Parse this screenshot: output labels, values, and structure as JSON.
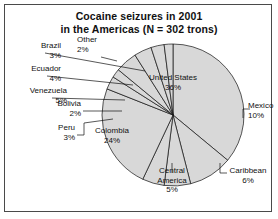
{
  "chart_data": {
    "type": "pie",
    "title": "Cocaine seizures in 2001 in the Americas (N = 302 trons)",
    "title_line1": "Cocaine seizures in 2001",
    "title_line2": "in the Americas (N = 302 trons)",
    "unit": "percent",
    "total_label": "N = 302 trons",
    "legend": "none",
    "grid": false,
    "slice_fill": "#d8d8d8",
    "slice_stroke": "#111111",
    "categories": [
      "United States",
      "Mexico",
      "Caribbean",
      "Central America",
      "Colombia",
      "Peru",
      "Bolivia",
      "Venezuela",
      "Ecuador",
      "Brazil",
      "Other"
    ],
    "values": [
      36,
      10,
      6,
      5,
      24,
      3,
      2,
      5,
      4,
      3,
      2
    ],
    "slices": [
      {
        "name": "United States",
        "pct": 36,
        "label": "United States",
        "value_label": "36%",
        "placement": "inside"
      },
      {
        "name": "Mexico",
        "pct": 10,
        "label": "Mexico",
        "value_label": "10%",
        "placement": "outside"
      },
      {
        "name": "Caribbean",
        "pct": 6,
        "label": "Caribbean",
        "value_label": "6%",
        "placement": "outside"
      },
      {
        "name": "Central America",
        "pct": 5,
        "label_line1": "Central",
        "label_line2": "America",
        "value_label": "5%",
        "placement": "outside"
      },
      {
        "name": "Colombia",
        "pct": 24,
        "label": "Colombia",
        "value_label": "24%",
        "placement": "inside"
      },
      {
        "name": "Peru",
        "pct": 3,
        "label": "Peru",
        "value_label": "3%",
        "placement": "outside"
      },
      {
        "name": "Bolivia",
        "pct": 2,
        "label": "Bolivia",
        "value_label": "2%",
        "placement": "outside"
      },
      {
        "name": "Venezuela",
        "pct": 5,
        "label": "Venezuela",
        "value_label": "5%",
        "placement": "outside"
      },
      {
        "name": "Ecuador",
        "pct": 4,
        "label": "Ecuador",
        "value_label": "4%",
        "placement": "outside"
      },
      {
        "name": "Brazil",
        "pct": 3,
        "label": "Brazil",
        "value_label": "3%",
        "placement": "outside"
      },
      {
        "name": "Other",
        "pct": 2,
        "label": "Other",
        "value_label": "2%",
        "placement": "outside"
      }
    ]
  }
}
